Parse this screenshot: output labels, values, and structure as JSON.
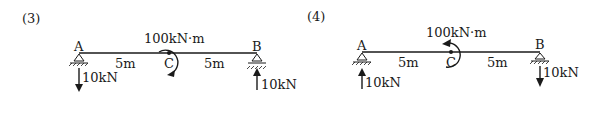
{
  "panels": [
    {
      "id": "(3)",
      "points": {
        "a": "A",
        "b": "B",
        "c": "C"
      },
      "spans": [
        "5m",
        "5m"
      ],
      "moment": {
        "label": "100kN·m",
        "direction": "clockwise"
      },
      "reactions": {
        "a": {
          "label": "10kN",
          "direction": "down"
        },
        "b": {
          "label": "10kN",
          "direction": "up"
        }
      }
    },
    {
      "id": "(4)",
      "points": {
        "a": "A",
        "b": "B",
        "c": "C"
      },
      "spans": [
        "5m",
        "5m"
      ],
      "moment": {
        "label": "100kN·m",
        "direction": "counterclockwise"
      },
      "reactions": {
        "a": {
          "label": "10kN",
          "direction": "up"
        },
        "b": {
          "label": "10kN",
          "direction": "down"
        }
      }
    }
  ],
  "colors": {
    "ink": "#1a1a1a",
    "background": "#ffffff"
  }
}
